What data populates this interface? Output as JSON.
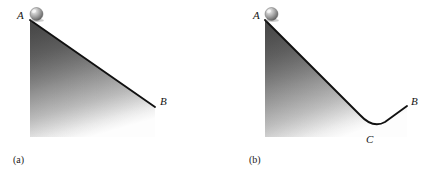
{
  "figure": {
    "background_color": "#ffffff",
    "stroke_color": "#111111",
    "fill_dark_color": "#5f5f5f",
    "fill_light_color": "#fdfdfd",
    "ball_highlight_color": "#e8e8e8",
    "ball_mid_color": "#9a9a9a",
    "ball_dark_color": "#4a4a4a"
  },
  "panels": [
    {
      "id": "a",
      "caption": "(a)",
      "description": "straight inclined plane from A down to B",
      "labels": {
        "start": "A",
        "end": "B"
      },
      "geometry": {
        "A": [
          30,
          20
        ],
        "B": [
          155,
          107
        ],
        "bottom_right": [
          155,
          137
        ],
        "bottom_left": [
          30,
          137
        ],
        "ball_center": [
          36.5,
          14
        ],
        "ball_radius": 6.5
      }
    },
    {
      "id": "b",
      "caption": "(b)",
      "description": "valley shaped path descending from A to the low point C then rising to B",
      "labels": {
        "start": "A",
        "low_point": "C",
        "end": "B"
      },
      "geometry": {
        "A": [
          265,
          20
        ],
        "C": [
          373,
          128
        ],
        "B": [
          407,
          106
        ],
        "bottom_right": [
          407,
          137
        ],
        "bottom_left": [
          265,
          137
        ],
        "ball_center": [
          271.5,
          14
        ],
        "ball_radius": 6.5
      }
    }
  ]
}
